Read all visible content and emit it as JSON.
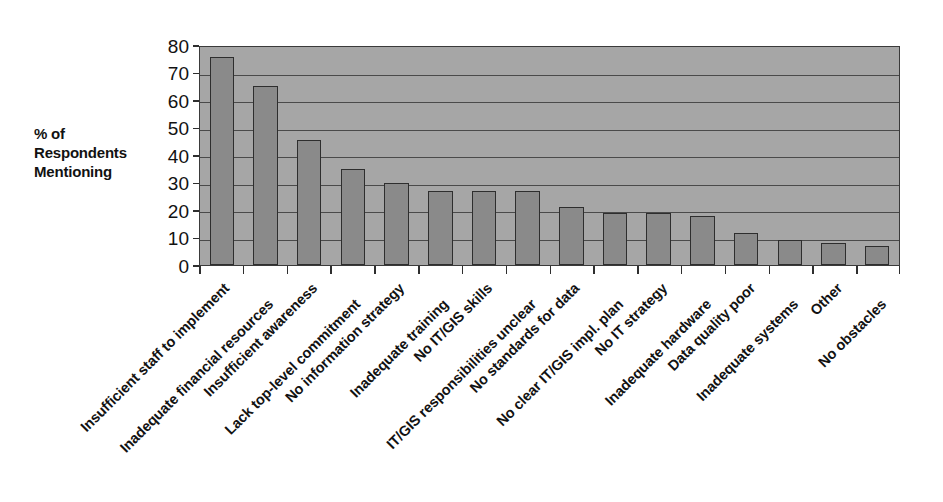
{
  "chart_data": {
    "type": "bar",
    "title": "",
    "subtitle": "",
    "xlabel": "",
    "ylabel": "% of Respondents Mentioning",
    "ylim": [
      0,
      80
    ],
    "ytick_step": 10,
    "yticks": [
      80,
      70,
      60,
      50,
      40,
      30,
      20,
      10,
      0
    ],
    "grid": true,
    "legend": "none",
    "categories": [
      "Insufficient staff to implement",
      "Inadequate financial resources",
      "Insufficient awareness",
      "Lack top-level commitment",
      "No information strategy",
      "Inadequate training",
      "No IT/GIS skills",
      "IT/GIS responsibilities unclear",
      "No standards for data",
      "No clear IT/GIS impl. plan",
      "No IT strategy",
      "Inadequate hardware",
      "Data quality poor",
      "Inadequate systems",
      "Other",
      "No obstacles"
    ],
    "values": [
      75.5,
      65,
      45.5,
      35,
      30,
      27,
      27,
      27,
      21,
      19,
      19,
      18,
      11.5,
      9,
      8,
      7
    ],
    "colors": {
      "bar_fill": "#8a8a8a",
      "bar_border": "#2e2e2e",
      "plot_background": "#a6a6a6",
      "gridline": "#4a4a4a",
      "axis": "#2e2e2e",
      "text": "#121212",
      "page_background": "#ffffff"
    }
  },
  "axis": {
    "y_title_lines": [
      "% of",
      "Respondents",
      "Mentioning"
    ]
  }
}
